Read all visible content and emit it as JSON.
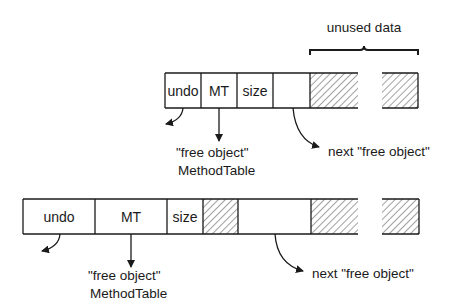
{
  "diagram": {
    "unused_label": "unused data",
    "top_row": {
      "cells": [
        "undo",
        "MT",
        "size",
        ""
      ],
      "mt_note_line1": "\"free object\"",
      "mt_note_line2": "MethodTable",
      "next_note": "next \"free object\""
    },
    "bottom_row": {
      "cells": [
        "undo",
        "MT",
        "size",
        "",
        ""
      ],
      "mt_note_line1": "\"free object\"",
      "mt_note_line2": "MethodTable",
      "next_note": "next \"free object\""
    },
    "colors": {
      "stroke": "#1a1a1a",
      "background": "#ffffff"
    }
  }
}
